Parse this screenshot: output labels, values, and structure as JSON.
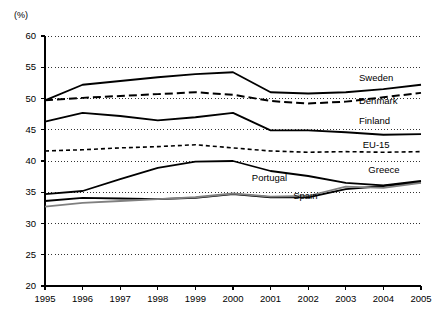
{
  "chart_data": {
    "type": "line",
    "title": "",
    "subtitle": "",
    "xlabel": "",
    "ylabel": "(%)",
    "unit_label": "(%)",
    "x": [
      1995,
      1996,
      1997,
      1998,
      1999,
      2000,
      2001,
      2002,
      2003,
      2004,
      2005
    ],
    "categories": [
      "1995",
      "1996",
      "1997",
      "1998",
      "1999",
      "2000",
      "2001",
      "2002",
      "2003",
      "2004",
      "2005"
    ],
    "xlim": [
      1995,
      2005
    ],
    "ylim": [
      20,
      60
    ],
    "yticks": [
      20,
      25,
      30,
      35,
      40,
      45,
      50,
      55,
      60
    ],
    "ytick_labels": [
      "20",
      "25",
      "30",
      "35",
      "40",
      "45",
      "50",
      "55",
      "60"
    ],
    "grid": true,
    "grid_style": "dotted",
    "legend": "inline-right-labels",
    "series": [
      {
        "name": "Sweden",
        "style": "solid",
        "color": "#000000",
        "width": 1.8,
        "values": [
          49.7,
          52.2,
          52.8,
          53.4,
          53.9,
          54.2,
          51.0,
          50.8,
          51.0,
          51.5,
          52.2
        ],
        "label_x": 2003.35,
        "label_y": 53.2
      },
      {
        "name": "Denmark",
        "style": "dashed",
        "color": "#000000",
        "width": 2.0,
        "values": [
          49.7,
          50.1,
          50.4,
          50.7,
          51.0,
          50.6,
          49.6,
          49.2,
          49.5,
          50.2,
          50.9
        ],
        "label_x": 2003.35,
        "label_y": 49.4
      },
      {
        "name": "Finland",
        "style": "solid",
        "color": "#000000",
        "width": 1.8,
        "values": [
          46.3,
          47.7,
          47.2,
          46.5,
          47.0,
          47.7,
          44.9,
          44.9,
          44.6,
          44.2,
          44.3
        ],
        "label_x": 2003.35,
        "label_y": 46.2
      },
      {
        "name": "EU-15",
        "style": "dotted-dashed",
        "color": "#000000",
        "width": 1.6,
        "values": [
          41.6,
          41.8,
          42.1,
          42.3,
          42.6,
          42.1,
          41.6,
          41.4,
          41.5,
          41.4,
          41.5
        ],
        "label_x": 2003.45,
        "label_y": 42.4
      },
      {
        "name": "Greece",
        "style": "solid",
        "color": "#000000",
        "width": 1.8,
        "values": [
          34.7,
          35.2,
          37.1,
          38.9,
          39.9,
          40.0,
          38.4,
          37.6,
          36.5,
          36.1,
          36.8
        ],
        "label_x": 2003.6,
        "label_y": 38.4
      },
      {
        "name": "Portugal",
        "style": "solid",
        "color": "#000000",
        "width": 1.8,
        "values": [
          33.6,
          34.1,
          34.0,
          33.9,
          34.1,
          34.7,
          34.2,
          34.2,
          35.5,
          36.0,
          36.6
        ],
        "label_x": 2000.5,
        "label_y": 37.1
      },
      {
        "name": "Spain",
        "style": "solid",
        "color": "#808080",
        "width": 1.8,
        "values": [
          32.7,
          33.3,
          33.6,
          33.9,
          34.2,
          34.8,
          34.3,
          34.4,
          35.9,
          35.7,
          36.5
        ],
        "label_x": 2001.6,
        "label_y": 34.2
      }
    ]
  },
  "axis": {
    "y_unit": "(%)"
  }
}
